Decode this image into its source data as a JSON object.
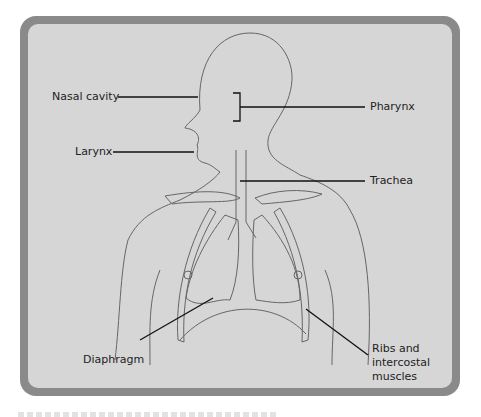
{
  "figure": {
    "labels": {
      "nasal_cavity": "Nasal cavity",
      "pharynx": "Pharynx",
      "larynx": "Larynx",
      "trachea": "Trachea",
      "diaphragm": "Diaphragm",
      "ribs": "Ribs and\nintercostal\nmuscles"
    },
    "colors": {
      "frame": "#8a8a8a",
      "panel": "#d6d6d6",
      "line": "#555555",
      "leader": "#111111"
    }
  }
}
